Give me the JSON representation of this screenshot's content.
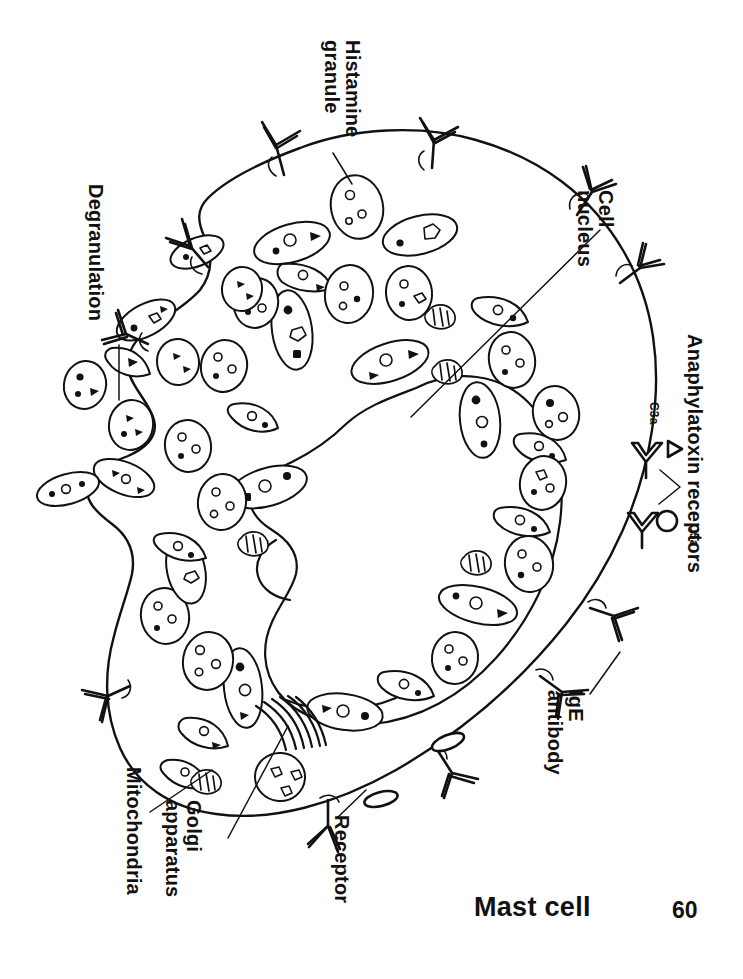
{
  "figure": {
    "title": "Mast cell",
    "page_number": "60",
    "kind": "labeled biological cell diagram"
  },
  "labels": {
    "histamine_granule": "Histamine\ngranule",
    "cell_nucleus": "Cell\nnucleus",
    "anaphylatoxin_receptors": "Anaphylatoxin receptors",
    "c3a": "C3a",
    "c5a": "C5a",
    "ige_antibody": "IgE\nantibody",
    "receptor": "Receptor",
    "golgi_apparatus": "Golgi\napparatus",
    "mitochondria": "Mitochondria",
    "degranulation": "Degranulation"
  },
  "colors": {
    "ink": "#111111",
    "paper": "#ffffff"
  },
  "structures": {
    "membrane": "irregular rounded cell outline with a notched left margin where degranulation occurs",
    "nucleus": "large kidney / bean shaped nucleus occupying the cell centre",
    "granules_inside": 34,
    "granules_released": 9,
    "ige_antibodies": 11,
    "anaphylatoxin_receptor_pairs": 2,
    "mitochondria": 5,
    "golgi_cisternae": 6,
    "membrane_receptors": 2
  }
}
